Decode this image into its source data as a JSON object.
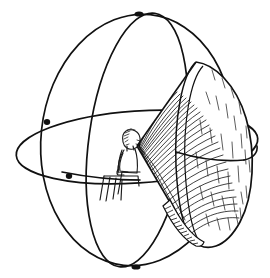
{
  "figure": {
    "title": "Observer inside sphere with projected viewing cone",
    "caption": "",
    "background_color": "#ffffff",
    "ink_color": "#111111",
    "canvas": {
      "width": 270,
      "height": 278
    },
    "style": "pen-and-ink line drawing with dense curved hatching"
  },
  "sphere": {
    "label": "wireframe sphere",
    "center": {
      "x": 137,
      "y": 140
    },
    "radius_x": 122,
    "radius_y": 125,
    "stroke_color": "#111111",
    "stroke_width": 1.6,
    "great_circles": [
      {
        "name": "horizontal-equator-ellipse",
        "orientation": "horizontal",
        "center": {
          "x": 137,
          "y": 147
        },
        "rx": 121,
        "ry": 36,
        "rotation_deg": -4
      },
      {
        "name": "vertical-meridian-front",
        "orientation": "vertical",
        "center": {
          "x": 137,
          "y": 140
        },
        "rx": 48,
        "ry": 128,
        "rotation_deg": 8
      },
      {
        "name": "vertical-meridian-side",
        "orientation": "vertical",
        "center": {
          "x": 137,
          "y": 140
        },
        "rx": 96,
        "ry": 126,
        "rotation_deg": 6
      }
    ],
    "pole_markers": [
      {
        "name": "north-pole-node",
        "x": 139,
        "y": 14
      },
      {
        "name": "south-pole-node",
        "x": 136,
        "y": 267
      },
      {
        "name": "left-equator-node",
        "x": 46,
        "y": 123
      },
      {
        "name": "left-lower-node",
        "x": 68,
        "y": 175
      },
      {
        "name": "right-equator-node",
        "x": 241,
        "y": 161
      }
    ]
  },
  "observer": {
    "label": "seated figure in profile",
    "facing": "right",
    "head": {
      "x": 128,
      "y": 138,
      "rx": 8,
      "ry": 9
    },
    "eye_level_y": 145,
    "parts": [
      "head",
      "hair-hatching",
      "neck",
      "torso",
      "arm",
      "hand",
      "thigh",
      "lower-leg",
      "seat"
    ],
    "stroke_color": "#1a1a1a",
    "stroke_width": 1.1
  },
  "cone": {
    "label": "viewing cone / projected dish",
    "apex": {
      "x": 137,
      "y": 146
    },
    "rim_center": {
      "x": 205,
      "y": 150
    },
    "rim_rx": 48,
    "rim_ry": 88,
    "rim_rotation_deg": -10,
    "hatch": {
      "name": "concentric-arc-hatching",
      "line_count": 46,
      "stroke_width": 0.75,
      "color": "#111111",
      "description": "dense concentric arcs fanning from apex across the inner cone surface"
    },
    "rim_band": {
      "name": "lower-rim-band",
      "description": "light band along lower-left rim with short perpendicular tick hatching",
      "tick_count": 26
    },
    "shading_flecks": {
      "name": "interior-shading-flecks",
      "count": 34,
      "description": "short scattered strokes suggesting the concave dish interior"
    }
  }
}
